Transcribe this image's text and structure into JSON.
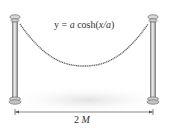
{
  "figure": {
    "equation": {
      "prefix": "y = ",
      "a": "a",
      "cosh": " cosh(",
      "arg": "x/a",
      "suffix": ")"
    },
    "dimension_label": {
      "number": "2 ",
      "var": "M"
    },
    "colors": {
      "post": "#c9c9c9",
      "post_edge": "#6f6f6f",
      "rope": "#6a6a6a",
      "shadow": "#e6e6e6",
      "text": "#333333"
    }
  }
}
